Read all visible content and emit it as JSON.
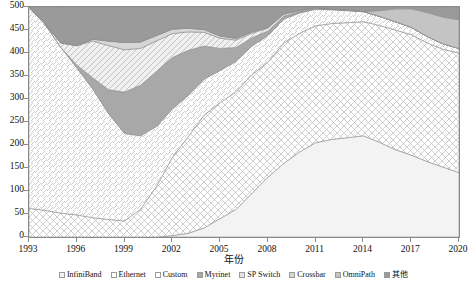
{
  "chart_data": {
    "type": "area",
    "stacked": true,
    "title": "",
    "xlabel": "年份",
    "ylabel": "",
    "x": [
      1993,
      1994,
      1995,
      1996,
      1997,
      1998,
      1999,
      2000,
      2001,
      2002,
      2003,
      2004,
      2005,
      2006,
      2007,
      2008,
      2009,
      2010,
      2011,
      2012,
      2013,
      2014,
      2015,
      2016,
      2017,
      2018,
      2019,
      2020
    ],
    "xlim": [
      1993,
      2020
    ],
    "ylim": [
      0,
      500
    ],
    "xticks": [
      1993,
      1996,
      1999,
      2002,
      2005,
      2008,
      2011,
      2014,
      2017,
      2020
    ],
    "yticks": [
      0,
      50,
      100,
      150,
      200,
      250,
      300,
      350,
      400,
      450,
      500
    ],
    "grid": false,
    "legend_position": "bottom",
    "series": [
      {
        "name": "InfiniBand",
        "pattern": "blank",
        "color": "#f2f2f2",
        "values": [
          0,
          0,
          0,
          0,
          0,
          0,
          0,
          0,
          0,
          3,
          8,
          20,
          40,
          60,
          95,
          130,
          160,
          185,
          205,
          212,
          216,
          220,
          206,
          190,
          178,
          164,
          152,
          140
        ]
      },
      {
        "name": "Ethernet",
        "pattern": "cross-hatch",
        "color": "#ffffff",
        "values": [
          62,
          58,
          52,
          48,
          42,
          38,
          35,
          60,
          110,
          170,
          210,
          245,
          252,
          256,
          258,
          250,
          262,
          258,
          254,
          252,
          250,
          248,
          254,
          260,
          262,
          258,
          256,
          260
        ]
      },
      {
        "name": "Custom",
        "pattern": "diagonal-up",
        "color": "#ffffff",
        "values": [
          438,
          405,
          360,
          320,
          280,
          230,
          190,
          160,
          130,
          105,
          90,
          78,
          70,
          66,
          62,
          58,
          52,
          44,
          36,
          30,
          26,
          22,
          20,
          18,
          16,
          14,
          12,
          10
        ]
      },
      {
        "name": "Myrinet",
        "pattern": "solid-gray",
        "color": "#a8a8a8",
        "values": [
          0,
          0,
          0,
          6,
          24,
          52,
          90,
          110,
          120,
          112,
          98,
          72,
          48,
          30,
          18,
          10,
          6,
          3,
          2,
          1,
          1,
          0,
          0,
          0,
          0,
          0,
          0,
          0
        ]
      },
      {
        "name": "SP Switch",
        "pattern": "diagonal-down",
        "color": "#e2e2e2",
        "values": [
          0,
          0,
          10,
          42,
          80,
          96,
          92,
          80,
          66,
          52,
          40,
          30,
          22,
          16,
          10,
          6,
          4,
          2,
          1,
          0,
          0,
          0,
          0,
          0,
          0,
          0,
          0,
          0
        ]
      },
      {
        "name": "Crossbar",
        "pattern": "light-gray",
        "color": "#d6d6d6",
        "values": [
          0,
          0,
          0,
          0,
          4,
          10,
          16,
          14,
          12,
          10,
          8,
          6,
          5,
          4,
          3,
          2,
          2,
          1,
          1,
          1,
          1,
          0,
          0,
          0,
          0,
          0,
          0,
          0
        ]
      },
      {
        "name": "OmniPath",
        "pattern": "mid-gray",
        "color": "#c4c4c4",
        "values": [
          0,
          0,
          0,
          0,
          0,
          0,
          0,
          0,
          0,
          0,
          0,
          0,
          0,
          0,
          0,
          0,
          0,
          0,
          0,
          0,
          0,
          0,
          12,
          28,
          40,
          52,
          58,
          62
        ]
      },
      {
        "name": "其他",
        "pattern": "dark-gray",
        "color": "#9a9a9a",
        "values": [
          0,
          37,
          78,
          84,
          70,
          74,
          77,
          76,
          62,
          48,
          46,
          49,
          63,
          68,
          54,
          44,
          14,
          7,
          1,
          4,
          6,
          10,
          8,
          4,
          4,
          12,
          22,
          28
        ]
      }
    ]
  },
  "axes": {
    "y_tick_labels": [
      "0",
      "50",
      "100",
      "150",
      "200",
      "250",
      "300",
      "350",
      "400",
      "450",
      "500"
    ],
    "x_tick_labels": [
      "1993",
      "1996",
      "1999",
      "2002",
      "2005",
      "2008",
      "2011",
      "2014",
      "2017",
      "2020"
    ],
    "x_title": "年份"
  },
  "legend": {
    "items": [
      {
        "label": "InfiniBand",
        "swatch": "#f2f2f2"
      },
      {
        "label": "Ethernet",
        "swatch": "#ffffff"
      },
      {
        "label": "Custom",
        "swatch": "#ffffff"
      },
      {
        "label": "Myrinet",
        "swatch": "#a8a8a8"
      },
      {
        "label": "SP Switch",
        "swatch": "#e2e2e2"
      },
      {
        "label": "Crossbar",
        "swatch": "#d6d6d6"
      },
      {
        "label": "OmniPath",
        "swatch": "#c4c4c4"
      },
      {
        "label": "其他",
        "swatch": "#9a9a9a"
      }
    ]
  }
}
